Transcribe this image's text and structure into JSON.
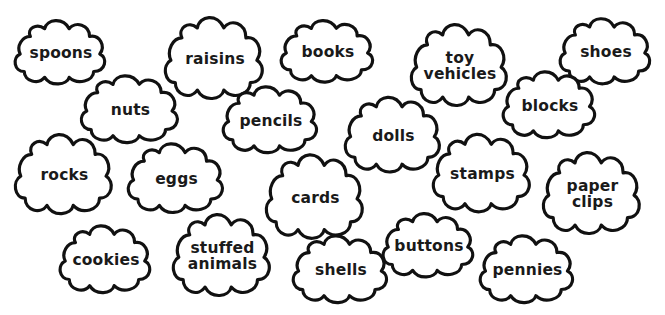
{
  "worksheet": {
    "top_text_cropped": "",
    "clouds": [
      {
        "id": "spoons",
        "label": "spoons",
        "x": 12,
        "y": 17,
        "w": 98,
        "h": 72
      },
      {
        "id": "raisins",
        "label": "raisins",
        "x": 162,
        "y": 13,
        "w": 106,
        "h": 92
      },
      {
        "id": "books",
        "label": "books",
        "x": 278,
        "y": 17,
        "w": 100,
        "h": 70
      },
      {
        "id": "toy-vehicles",
        "label": "toy\nvehicles",
        "x": 408,
        "y": 20,
        "w": 104,
        "h": 92
      },
      {
        "id": "shoes",
        "label": "shoes",
        "x": 557,
        "y": 15,
        "w": 98,
        "h": 74
      },
      {
        "id": "nuts",
        "label": "nuts",
        "x": 78,
        "y": 72,
        "w": 105,
        "h": 76
      },
      {
        "id": "pencils",
        "label": "pencils",
        "x": 220,
        "y": 83,
        "w": 102,
        "h": 75
      },
      {
        "id": "dolls",
        "label": "dolls",
        "x": 342,
        "y": 93,
        "w": 103,
        "h": 85
      },
      {
        "id": "blocks",
        "label": "blocks",
        "x": 500,
        "y": 68,
        "w": 100,
        "h": 75
      },
      {
        "id": "rocks",
        "label": "rocks",
        "x": 12,
        "y": 130,
        "w": 105,
        "h": 90
      },
      {
        "id": "eggs",
        "label": "eggs",
        "x": 125,
        "y": 140,
        "w": 103,
        "h": 78
      },
      {
        "id": "cards",
        "label": "cards",
        "x": 263,
        "y": 150,
        "w": 105,
        "h": 95
      },
      {
        "id": "stamps",
        "label": "stamps",
        "x": 430,
        "y": 130,
        "w": 105,
        "h": 88
      },
      {
        "id": "paper-clips",
        "label": "paper\nclips",
        "x": 540,
        "y": 148,
        "w": 105,
        "h": 92
      },
      {
        "id": "cookies",
        "label": "cookies",
        "x": 57,
        "y": 222,
        "w": 98,
        "h": 76
      },
      {
        "id": "stuffed-animals",
        "label": "stuffed\nanimals",
        "x": 170,
        "y": 210,
        "w": 105,
        "h": 92
      },
      {
        "id": "shells",
        "label": "shells",
        "x": 290,
        "y": 232,
        "w": 102,
        "h": 76
      },
      {
        "id": "buttons",
        "label": "buttons",
        "x": 380,
        "y": 210,
        "w": 98,
        "h": 72
      },
      {
        "id": "pennies",
        "label": "pennies",
        "x": 477,
        "y": 232,
        "w": 101,
        "h": 76
      }
    ]
  },
  "colors": {
    "outline": "#111111",
    "fill": "#ffffff",
    "text": "#1a1a1a"
  }
}
